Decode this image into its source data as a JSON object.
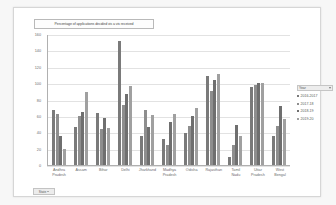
{
  "chart_title": "Percentage of applications decided vis a vis received",
  "filter_button": {
    "label": "State",
    "icon": "funnel-icon"
  },
  "legend": {
    "header_label": "Year",
    "header_icon": "chevron-down-icon",
    "entries": [
      {
        "label": "2016-2017",
        "color": "#7a7a7a"
      },
      {
        "label": "2017-18",
        "color": "#8e8e8e"
      },
      {
        "label": "2018-19",
        "color": "#6f6f6f"
      },
      {
        "label": "2019-20",
        "color": "#a0a0a0"
      }
    ]
  },
  "chart_data": {
    "type": "bar",
    "title": "Percentage of applications decided vis a vis received",
    "xlabel": "",
    "ylabel": "",
    "ylim": [
      0,
      160
    ],
    "yticks": [
      0,
      20,
      40,
      60,
      80,
      100,
      120,
      140,
      160
    ],
    "grid": true,
    "legend_position": "right",
    "categories": [
      "Andhra Pradesh",
      "Assam",
      "Bihar",
      "Delhi",
      "Jharkhand",
      "Madhya Pradesh",
      "Odisha",
      "Rajasthan",
      "Tamil Nadu",
      "Uttar Pradesh",
      "West Bengal"
    ],
    "series": [
      {
        "name": "2016-2017",
        "values": [
          67,
          46,
          63,
          82,
          36,
          32,
          39,
          109,
          10,
          95,
          36
        ]
      },
      {
        "name": "2017-18",
        "values": [
          62,
          60,
          44,
          73,
          67,
          25,
          48,
          91,
          25,
          98,
          48
        ]
      },
      {
        "name": "2018-19",
        "values": [
          35,
          65,
          57,
          87,
          47,
          53,
          60,
          104,
          49,
          100,
          72
        ]
      },
      {
        "name": "2019-20",
        "values": [
          20,
          89,
          45,
          96,
          61,
          62,
          70,
          111,
          36,
          100,
          56
        ]
      }
    ],
    "annotations": [
      {
        "text": "Delhi 2016-2017 peaks at 152",
        "category": "Delhi",
        "series": "2016-2017",
        "value": 152
      }
    ]
  }
}
